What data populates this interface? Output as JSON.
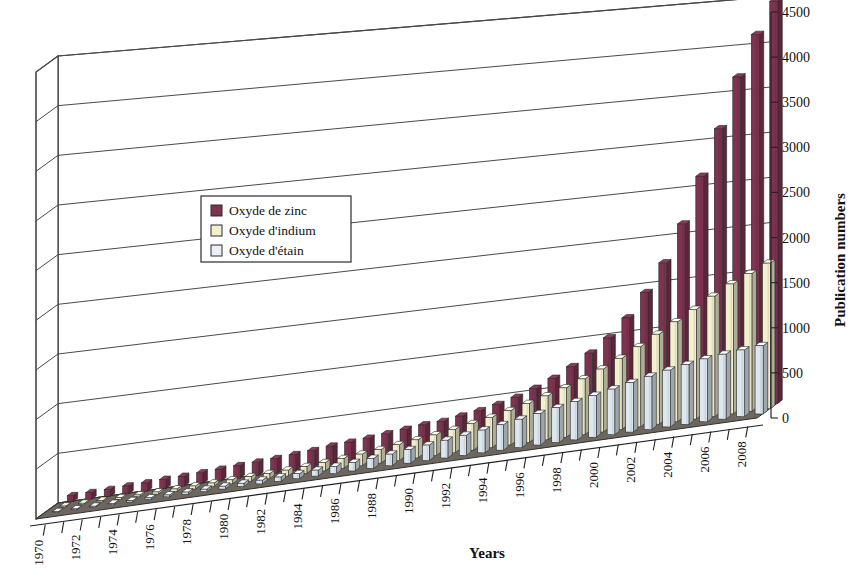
{
  "chart_data": {
    "type": "bar",
    "title": "",
    "subtitle": "",
    "xlabel": "Years",
    "ylabel": "Publication numbers",
    "ylim": [
      0,
      4500
    ],
    "ytick_step": 500,
    "yticks": [
      "0",
      "500",
      "1000",
      "1500",
      "2000",
      "2500",
      "3000",
      "3500",
      "4000",
      "4500"
    ],
    "grid": true,
    "three_d": true,
    "legend_position": "upper-left-inside",
    "categories": [
      "1970",
      "1971",
      "1972",
      "1973",
      "1974",
      "1975",
      "1976",
      "1977",
      "1978",
      "1979",
      "1980",
      "1981",
      "1982",
      "1983",
      "1984",
      "1985",
      "1986",
      "1987",
      "1988",
      "1989",
      "1990",
      "1991",
      "1992",
      "1993",
      "1994",
      "1995",
      "1996",
      "1997",
      "1998",
      "1999",
      "2000",
      "2001",
      "2002",
      "2003",
      "2004",
      "2005",
      "2006",
      "2007",
      "2008"
    ],
    "xtick_labels": [
      "1970",
      "",
      "1972",
      "",
      "1974",
      "",
      "1976",
      "",
      "1978",
      "",
      "1980",
      "",
      "1982",
      "",
      "1984",
      "",
      "1986",
      "",
      "1988",
      "",
      "1990",
      "",
      "1992",
      "",
      "1994",
      "",
      "1996",
      "",
      "1998",
      "",
      "2000",
      "",
      "2002",
      "",
      "2004",
      "",
      "2006",
      "",
      "2008"
    ],
    "series": [
      {
        "name": "Oxyde de zinc",
        "color": "#7e3350",
        "values": [
          60,
          65,
          70,
          80,
          85,
          95,
          100,
          110,
          120,
          130,
          140,
          150,
          165,
          180,
          200,
          215,
          230,
          250,
          270,
          290,
          300,
          330,
          360,
          400,
          450,
          520,
          600,
          700,
          820,
          960,
          1150,
          1400,
          1700,
          2100,
          2600,
          3100,
          3650,
          4100,
          4450
        ]
      },
      {
        "name": "Oxyde d'indium",
        "color": "#f2f0cf",
        "values": [
          10,
          12,
          14,
          16,
          18,
          22,
          26,
          30,
          34,
          40,
          46,
          52,
          60,
          70,
          85,
          100,
          120,
          140,
          165,
          190,
          215,
          245,
          280,
          320,
          365,
          415,
          470,
          530,
          600,
          680,
          770,
          870,
          980,
          1090,
          1200,
          1320,
          1430,
          1520,
          1610
        ]
      },
      {
        "name": "Oxyde d'étain",
        "color": "#dce7ef",
        "values": [
          8,
          9,
          10,
          12,
          14,
          16,
          19,
          22,
          25,
          29,
          33,
          38,
          44,
          52,
          62,
          74,
          88,
          104,
          122,
          142,
          164,
          188,
          214,
          242,
          272,
          304,
          338,
          374,
          412,
          452,
          494,
          538,
          580,
          620,
          655,
          690,
          715,
          735,
          755
        ]
      }
    ]
  },
  "axes": {
    "y_title": "Publication numbers",
    "x_title": "Years"
  },
  "legend": {
    "items": [
      {
        "label": "Oxyde de zinc",
        "swatch": "#7e3350"
      },
      {
        "label": "Oxyde d'indium",
        "swatch": "#f2f0cf"
      },
      {
        "label": "Oxyde d'étain",
        "swatch": "#e9eff5"
      }
    ]
  },
  "colors": {
    "zinc": "#7e3350",
    "indium": "#f2f0cf",
    "tin": "#dce7ef",
    "floor": "#6e6760",
    "gridline": "#4a4a4a",
    "background": "#ffffff"
  }
}
